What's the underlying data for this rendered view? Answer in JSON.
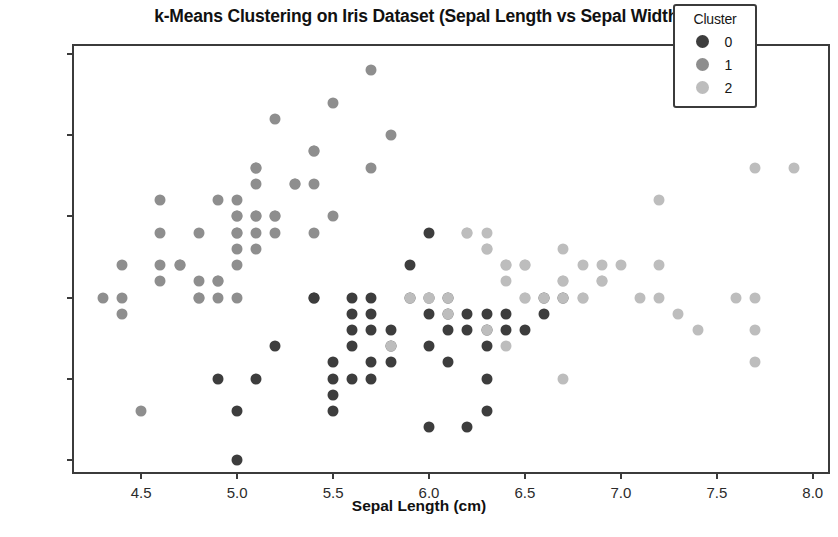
{
  "chart_data": {
    "type": "scatter",
    "title": "k-Means Clustering on Iris Dataset (Sepal Length vs Sepal Width)",
    "xlabel": "Sepal Length (cm)",
    "ylabel": "Sepal Width (cm)",
    "xlim": [
      4.15,
      8.1
    ],
    "ylim": [
      1.9,
      4.55
    ],
    "xticks": [
      "4.5",
      "5.0",
      "5.5",
      "6.0",
      "6.5",
      "7.0",
      "7.5",
      "8.0"
    ],
    "xtick_values": [
      4.5,
      5.0,
      5.5,
      6.0,
      6.5,
      7.0,
      7.5,
      8.0
    ],
    "yticks": [
      "2.0",
      "2.5",
      "3.0",
      "3.5",
      "4.0",
      "4.5"
    ],
    "ytick_values": [
      2.0,
      2.5,
      3.0,
      3.5,
      4.0,
      4.5
    ],
    "grid": false,
    "legend": {
      "title": "Cluster",
      "position": "upper right",
      "entries": [
        {
          "label": "0",
          "color": "#3d3d3d"
        },
        {
          "label": "1",
          "color": "#8e8e8e"
        },
        {
          "label": "2",
          "color": "#bdbdbd"
        }
      ]
    },
    "marker_size": 11,
    "series": [
      {
        "name": "0",
        "color": "#3d3d3d",
        "points": [
          [
            4.9,
            2.5
          ],
          [
            5.0,
            2.0
          ],
          [
            5.0,
            2.3
          ],
          [
            5.1,
            2.5
          ],
          [
            5.4,
            3.0
          ],
          [
            5.5,
            2.3
          ],
          [
            5.5,
            2.4
          ],
          [
            5.5,
            2.5
          ],
          [
            5.5,
            2.6
          ],
          [
            5.6,
            2.5
          ],
          [
            5.6,
            2.7
          ],
          [
            5.6,
            2.8
          ],
          [
            5.6,
            2.9
          ],
          [
            5.6,
            3.0
          ],
          [
            5.7,
            2.5
          ],
          [
            5.7,
            2.6
          ],
          [
            5.7,
            2.8
          ],
          [
            5.7,
            2.9
          ],
          [
            5.7,
            3.0
          ],
          [
            5.8,
            2.6
          ],
          [
            5.8,
            2.7
          ],
          [
            5.8,
            2.8
          ],
          [
            5.9,
            3.0
          ],
          [
            5.9,
            3.2
          ],
          [
            6.0,
            2.2
          ],
          [
            6.0,
            2.7
          ],
          [
            6.0,
            2.9
          ],
          [
            6.0,
            3.0
          ],
          [
            6.0,
            3.4
          ],
          [
            6.1,
            2.6
          ],
          [
            6.1,
            2.8
          ],
          [
            6.1,
            2.9
          ],
          [
            6.1,
            3.0
          ],
          [
            6.2,
            2.2
          ],
          [
            6.2,
            2.8
          ],
          [
            6.2,
            2.9
          ],
          [
            6.3,
            2.3
          ],
          [
            6.3,
            2.5
          ],
          [
            6.3,
            2.7
          ],
          [
            6.3,
            2.8
          ],
          [
            6.3,
            2.9
          ],
          [
            6.4,
            2.8
          ],
          [
            6.4,
            2.9
          ],
          [
            6.5,
            2.8
          ],
          [
            6.6,
            2.9
          ],
          [
            6.6,
            3.0
          ],
          [
            5.2,
            2.7
          ],
          [
            5.4,
            3.0
          ],
          [
            6.7,
            3.0
          ]
        ]
      },
      {
        "name": "1",
        "color": "#8e8e8e",
        "points": [
          [
            4.3,
            3.0
          ],
          [
            4.4,
            2.9
          ],
          [
            4.4,
            3.0
          ],
          [
            4.4,
            3.2
          ],
          [
            4.6,
            3.1
          ],
          [
            4.6,
            3.2
          ],
          [
            4.6,
            3.4
          ],
          [
            4.6,
            3.6
          ],
          [
            4.7,
            3.2
          ],
          [
            4.8,
            3.0
          ],
          [
            4.8,
            3.1
          ],
          [
            4.8,
            3.4
          ],
          [
            4.9,
            3.0
          ],
          [
            4.9,
            3.1
          ],
          [
            4.9,
            3.6
          ],
          [
            5.0,
            3.0
          ],
          [
            5.0,
            3.2
          ],
          [
            5.0,
            3.3
          ],
          [
            5.0,
            3.4
          ],
          [
            5.0,
            3.5
          ],
          [
            5.0,
            3.6
          ],
          [
            5.1,
            3.3
          ],
          [
            5.1,
            3.4
          ],
          [
            5.1,
            3.5
          ],
          [
            5.1,
            3.7
          ],
          [
            5.1,
            3.8
          ],
          [
            5.2,
            3.4
          ],
          [
            5.2,
            3.5
          ],
          [
            5.2,
            4.1
          ],
          [
            5.3,
            3.7
          ],
          [
            5.4,
            3.4
          ],
          [
            5.4,
            3.7
          ],
          [
            5.4,
            3.9
          ],
          [
            5.5,
            3.5
          ],
          [
            5.5,
            4.2
          ],
          [
            5.7,
            3.8
          ],
          [
            5.7,
            4.4
          ],
          [
            5.8,
            4.0
          ],
          [
            4.5,
            2.3
          ],
          [
            5.1,
            3.8
          ],
          [
            4.7,
            3.2
          ],
          [
            5.4,
            3.9
          ],
          [
            5.0,
            3.4
          ],
          [
            4.8,
            3.0
          ],
          [
            5.1,
            3.5
          ],
          [
            5.2,
            3.5
          ],
          [
            4.9,
            3.1
          ],
          [
            5.0,
            3.5
          ],
          [
            5.3,
            3.7
          ]
        ]
      },
      {
        "name": "2",
        "color": "#bdbdbd",
        "points": [
          [
            5.8,
            2.7
          ],
          [
            5.9,
            3.0
          ],
          [
            6.0,
            3.0
          ],
          [
            6.1,
            3.0
          ],
          [
            6.2,
            3.4
          ],
          [
            6.3,
            3.3
          ],
          [
            6.3,
            3.4
          ],
          [
            6.4,
            3.1
          ],
          [
            6.4,
            3.2
          ],
          [
            6.5,
            3.0
          ],
          [
            6.5,
            3.2
          ],
          [
            6.7,
            2.5
          ],
          [
            6.7,
            3.0
          ],
          [
            6.7,
            3.1
          ],
          [
            6.7,
            3.3
          ],
          [
            6.8,
            3.0
          ],
          [
            6.8,
            3.2
          ],
          [
            6.9,
            3.1
          ],
          [
            6.9,
            3.2
          ],
          [
            7.0,
            3.2
          ],
          [
            7.1,
            3.0
          ],
          [
            7.2,
            3.0
          ],
          [
            7.2,
            3.2
          ],
          [
            7.2,
            3.6
          ],
          [
            7.3,
            2.9
          ],
          [
            7.4,
            2.8
          ],
          [
            7.6,
            3.0
          ],
          [
            7.7,
            2.6
          ],
          [
            7.7,
            2.8
          ],
          [
            7.7,
            3.0
          ],
          [
            7.7,
            3.8
          ],
          [
            7.9,
            3.8
          ],
          [
            6.4,
            2.7
          ],
          [
            6.5,
            3.0
          ],
          [
            6.6,
            3.0
          ],
          [
            6.3,
            2.8
          ],
          [
            6.2,
            3.4
          ],
          [
            6.0,
            3.0
          ],
          [
            6.1,
            2.9
          ],
          [
            6.4,
            3.2
          ],
          [
            6.3,
            3.3
          ],
          [
            6.9,
            3.1
          ],
          [
            6.7,
            3.1
          ],
          [
            6.5,
            3.2
          ],
          [
            6.8,
            3.0
          ]
        ]
      }
    ]
  }
}
